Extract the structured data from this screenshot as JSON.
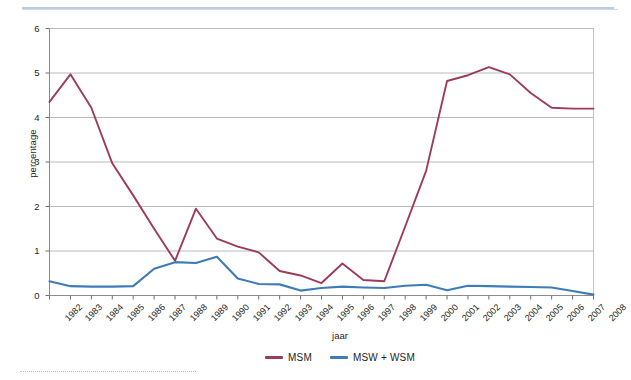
{
  "chart_data": {
    "type": "line",
    "title": "",
    "xlabel": "jaar",
    "ylabel": "percentage",
    "ylim": [
      0,
      6
    ],
    "yticks": [
      0,
      1,
      2,
      3,
      4,
      5,
      6
    ],
    "grid": true,
    "legend_position": "bottom-center",
    "categories": [
      "1982",
      "1983",
      "1984",
      "1985",
      "1986",
      "1987",
      "1988",
      "1989",
      "1990",
      "1991",
      "1992",
      "1993",
      "1994",
      "1995",
      "1996",
      "1997",
      "1998",
      "1999",
      "2000",
      "2001",
      "2002",
      "2003",
      "2004",
      "2005",
      "2006",
      "2007",
      "2008"
    ],
    "series": [
      {
        "name": "MSM",
        "color": "#9d3b5c",
        "values": [
          4.35,
          4.97,
          4.22,
          2.97,
          2.25,
          1.5,
          0.78,
          1.95,
          1.28,
          1.1,
          0.97,
          0.55,
          0.45,
          0.28,
          0.72,
          0.35,
          0.32,
          1.55,
          2.8,
          4.82,
          4.95,
          5.13,
          4.97,
          4.55,
          4.22,
          4.2,
          4.2
        ]
      },
      {
        "name": "MSW + WSM",
        "color": "#3e7cb8",
        "values": [
          0.32,
          0.21,
          0.2,
          0.2,
          0.21,
          0.6,
          0.75,
          0.73,
          0.87,
          0.38,
          0.26,
          0.25,
          0.11,
          0.17,
          0.2,
          0.18,
          0.17,
          0.22,
          0.24,
          0.12,
          0.22,
          0.21,
          0.2,
          0.19,
          0.18,
          0.1,
          0.02
        ]
      }
    ]
  },
  "legend": {
    "items": [
      {
        "label": "MSM",
        "color": "#9d3b5c"
      },
      {
        "label": "MSW + WSM",
        "color": "#3e7cb8"
      }
    ]
  },
  "axes": {
    "y_axis_label": "percentage",
    "x_axis_label": "jaar"
  }
}
